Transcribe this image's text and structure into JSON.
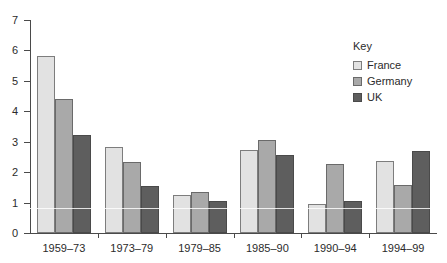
{
  "chart_data": {
    "type": "bar",
    "title": "",
    "subtitle": "",
    "xlabel": "",
    "ylabel": "",
    "categories": [
      "1959–73",
      "1973–79",
      "1979–85",
      "1985–90",
      "1990–94",
      "1994–99"
    ],
    "series": [
      {
        "name": "France",
        "color": "#e2e2e2",
        "values": [
          5.82,
          2.82,
          1.24,
          2.74,
          0.96,
          2.37
        ]
      },
      {
        "name": "Germany",
        "color": "#a9a9a9",
        "values": [
          4.42,
          2.32,
          1.34,
          3.05,
          2.26,
          1.57
        ]
      },
      {
        "name": "UK",
        "color": "#5e5e5e",
        "values": [
          3.22,
          1.53,
          1.04,
          2.55,
          1.06,
          2.68
        ]
      }
    ],
    "ylim": [
      0,
      7
    ],
    "ytick_labels": [
      "0",
      "1",
      "2",
      "3",
      "4",
      "5",
      "6",
      "7"
    ],
    "ytick_values": [
      0,
      1,
      2,
      3,
      4,
      5,
      6,
      7
    ],
    "grid": false,
    "legend_position": "upper-right"
  },
  "legend": {
    "title": "Key",
    "entries": [
      {
        "label": "France",
        "swatch": "light-gray-swatch"
      },
      {
        "label": "Germany",
        "swatch": "medium-gray-swatch"
      },
      {
        "label": "UK",
        "swatch": "dark-gray-swatch"
      }
    ]
  }
}
